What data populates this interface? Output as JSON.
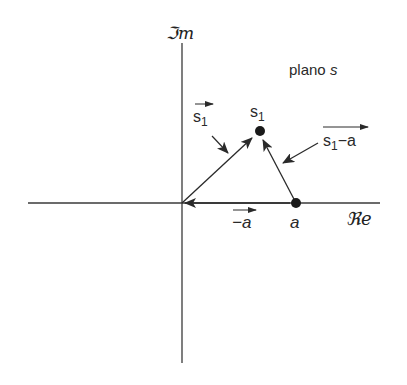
{
  "diagram": {
    "plane_label": {
      "text": "plano ",
      "var": "s"
    },
    "axes": {
      "imaginary_label": "ℑm",
      "real_label": "ℜe"
    },
    "points": [
      {
        "id": "s1",
        "label": "s",
        "subscript": "1"
      },
      {
        "id": "a",
        "label": "a"
      }
    ],
    "vectors": [
      {
        "id": "vec-s1",
        "label": "s",
        "subscript": "1",
        "from": "origin",
        "to": "s1"
      },
      {
        "id": "vec-s1-minus-a",
        "label": "s",
        "subscript": "1",
        "suffix": "−a",
        "from": "a",
        "to": "s1"
      },
      {
        "id": "vec-minus-a",
        "label": "−a",
        "from": "a",
        "to": "origin"
      }
    ],
    "colors": {
      "ink": "#2a2a2a",
      "background": "#ffffff"
    }
  }
}
